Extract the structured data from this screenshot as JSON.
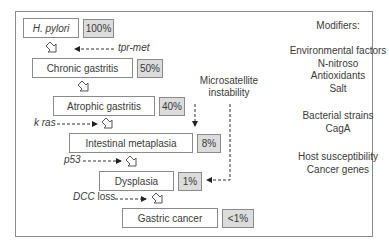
{
  "stages": [
    {
      "name": "H. pylori",
      "percent": "100%"
    },
    {
      "name": "Chronic gastritis",
      "percent": "50%"
    },
    {
      "name": "Atrophic gastritis",
      "percent": "40%"
    },
    {
      "name": "Intestinal metaplasia",
      "percent": "8%"
    },
    {
      "name": "Dysplasia",
      "percent": "1%"
    },
    {
      "name": "Gastric cancer",
      "percent": "<1%"
    }
  ],
  "genetic_events": {
    "tpr_met": "tpr-met",
    "k_ras": "k ras",
    "p53": "p53",
    "dcc_prefix": "DCC",
    "dcc_suffix": " loss",
    "microsatellite_line1": "Microsatellite",
    "microsatellite_line2": "instability"
  },
  "modifiers": {
    "title": "Modifiers:",
    "environmental": [
      "Environmental factors",
      "N-nitroso",
      "Antioxidants",
      "Salt"
    ],
    "bacterial": [
      "Bacterial strains",
      "CagA"
    ],
    "host": [
      "Host susceptibility",
      "Cancer genes"
    ]
  },
  "colors": {
    "border": "#8a8a8a",
    "percent_fill": "#dcdcdc",
    "text": "#3a3a3a"
  }
}
